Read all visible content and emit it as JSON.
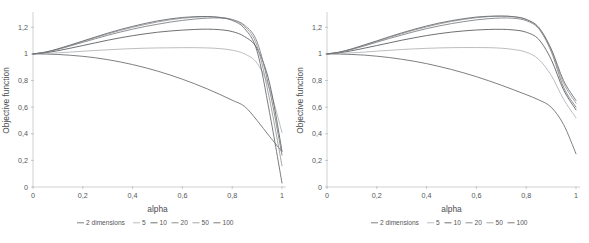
{
  "figure": {
    "panel_count": 2,
    "background_color": "#ffffff"
  },
  "panels": [
    {
      "name": "left-panel",
      "xlabel": "alpha",
      "ylabel": "Objective function",
      "x_ticks": [
        "0",
        "0,2",
        "0,4",
        "0,6",
        "0,8",
        "1"
      ],
      "y_ticks": [
        "0",
        "0,2",
        "0,4",
        "0,6",
        "0,8",
        "1",
        "1,2"
      ],
      "legend_prefix": "2 dimensions",
      "legend_items": [
        "5",
        "10",
        "20",
        "50",
        "100"
      ]
    },
    {
      "name": "right-panel",
      "xlabel": "alpha",
      "ylabel": "Objective function",
      "x_ticks": [
        "0",
        "0,2",
        "0,4",
        "0,6",
        "0,8",
        "1"
      ],
      "y_ticks": [
        "0",
        "0,2",
        "0,4",
        "0,6",
        "0,8",
        "1",
        "1,2"
      ],
      "legend_prefix": "2 dimensions",
      "legend_items": [
        "5",
        "10",
        "20",
        "50",
        "100"
      ]
    }
  ],
  "chart_data": [
    {
      "type": "line",
      "title": "",
      "panel": "left",
      "xlabel": "alpha",
      "ylabel": "Objective function",
      "xlim": [
        0,
        1
      ],
      "ylim": [
        0,
        1.3
      ],
      "x_ticks": [
        0,
        0.2,
        0.4,
        0.6,
        0.8,
        1
      ],
      "y_ticks": [
        0,
        0.2,
        0.4,
        0.6,
        0.8,
        1,
        1.2
      ],
      "grid": false,
      "legend_position": "below-axis",
      "legend_title": "2 dimensions",
      "x": [
        0,
        0.05,
        0.1,
        0.15,
        0.2,
        0.25,
        0.3,
        0.35,
        0.4,
        0.45,
        0.5,
        0.55,
        0.6,
        0.65,
        0.7,
        0.75,
        0.8,
        0.85,
        0.9,
        0.95,
        1
      ],
      "series": [
        {
          "name": "2",
          "color": "#6e7073",
          "values": [
            1.0,
            0.999,
            0.996,
            0.99,
            0.982,
            0.971,
            0.957,
            0.94,
            0.92,
            0.897,
            0.871,
            0.842,
            0.81,
            0.775,
            0.737,
            0.696,
            0.652,
            0.605,
            0.5,
            0.38,
            0.265
          ]
        },
        {
          "name": "5",
          "color": "#b4b6b8",
          "values": [
            1.0,
            1.003,
            1.008,
            1.014,
            1.02,
            1.026,
            1.031,
            1.036,
            1.04,
            1.043,
            1.045,
            1.046,
            1.047,
            1.047,
            1.045,
            1.04,
            1.028,
            1.0,
            0.93,
            0.74,
            0.41
          ]
        },
        {
          "name": "10",
          "color": "#5d6063",
          "values": [
            1.0,
            1.009,
            1.024,
            1.043,
            1.063,
            1.083,
            1.103,
            1.121,
            1.137,
            1.151,
            1.163,
            1.172,
            1.179,
            1.184,
            1.186,
            1.182,
            1.168,
            1.13,
            1.04,
            0.78,
            0.27
          ]
        },
        {
          "name": "20",
          "color": "#808285",
          "values": [
            1.0,
            1.012,
            1.034,
            1.06,
            1.087,
            1.114,
            1.14,
            1.164,
            1.186,
            1.206,
            1.223,
            1.239,
            1.252,
            1.262,
            1.269,
            1.27,
            1.258,
            1.215,
            1.09,
            0.73,
            0.24
          ]
        },
        {
          "name": "50",
          "color": "#9a9c9f",
          "values": [
            1.0,
            1.013,
            1.036,
            1.064,
            1.093,
            1.122,
            1.15,
            1.176,
            1.2,
            1.221,
            1.24,
            1.256,
            1.268,
            1.276,
            1.279,
            1.275,
            1.258,
            1.205,
            1.06,
            0.66,
            0.16
          ]
        },
        {
          "name": "100",
          "color": "#6b6d70",
          "values": [
            1.0,
            1.014,
            1.038,
            1.067,
            1.097,
            1.127,
            1.156,
            1.183,
            1.207,
            1.229,
            1.248,
            1.263,
            1.274,
            1.28,
            1.281,
            1.274,
            1.252,
            1.19,
            1.02,
            0.56,
            0.03
          ]
        }
      ]
    },
    {
      "type": "line",
      "title": "",
      "panel": "right",
      "xlabel": "alpha",
      "ylabel": "Objective function",
      "xlim": [
        0,
        1
      ],
      "ylim": [
        0,
        1.3
      ],
      "x_ticks": [
        0,
        0.2,
        0.4,
        0.6,
        0.8,
        1
      ],
      "y_ticks": [
        0,
        0.2,
        0.4,
        0.6,
        0.8,
        1,
        1.2
      ],
      "grid": false,
      "legend_position": "below-axis",
      "legend_title": "2 dimensions",
      "x": [
        0,
        0.05,
        0.1,
        0.15,
        0.2,
        0.25,
        0.3,
        0.35,
        0.4,
        0.45,
        0.5,
        0.55,
        0.6,
        0.65,
        0.7,
        0.75,
        0.8,
        0.85,
        0.9,
        0.95,
        1
      ],
      "series": [
        {
          "name": "2",
          "color": "#6e7073",
          "values": [
            1.0,
            0.999,
            0.996,
            0.991,
            0.983,
            0.973,
            0.96,
            0.945,
            0.927,
            0.906,
            0.883,
            0.857,
            0.829,
            0.798,
            0.765,
            0.73,
            0.694,
            0.655,
            0.6,
            0.47,
            0.25
          ]
        },
        {
          "name": "5",
          "color": "#b4b6b8",
          "values": [
            1.0,
            1.003,
            1.008,
            1.014,
            1.021,
            1.027,
            1.033,
            1.038,
            1.042,
            1.045,
            1.047,
            1.048,
            1.048,
            1.047,
            1.043,
            1.033,
            1.013,
            0.96,
            0.84,
            0.66,
            0.52
          ]
        },
        {
          "name": "10",
          "color": "#5d6063",
          "values": [
            1.0,
            1.009,
            1.024,
            1.043,
            1.063,
            1.083,
            1.103,
            1.121,
            1.138,
            1.152,
            1.164,
            1.173,
            1.18,
            1.184,
            1.185,
            1.18,
            1.163,
            1.11,
            0.96,
            0.73,
            0.58
          ]
        },
        {
          "name": "20",
          "color": "#808285",
          "values": [
            1.0,
            1.012,
            1.034,
            1.06,
            1.088,
            1.116,
            1.142,
            1.167,
            1.19,
            1.21,
            1.228,
            1.243,
            1.256,
            1.265,
            1.27,
            1.268,
            1.25,
            1.19,
            1.02,
            0.75,
            0.6
          ]
        },
        {
          "name": "50",
          "color": "#9a9c9f",
          "values": [
            1.0,
            1.013,
            1.037,
            1.065,
            1.094,
            1.124,
            1.152,
            1.179,
            1.203,
            1.225,
            1.244,
            1.26,
            1.272,
            1.28,
            1.283,
            1.279,
            1.258,
            1.195,
            1.03,
            0.78,
            0.63
          ]
        },
        {
          "name": "100",
          "color": "#6b6d70",
          "values": [
            1.0,
            1.014,
            1.038,
            1.068,
            1.098,
            1.129,
            1.158,
            1.185,
            1.21,
            1.232,
            1.25,
            1.265,
            1.277,
            1.283,
            1.285,
            1.28,
            1.26,
            1.2,
            1.04,
            0.8,
            0.65
          ]
        }
      ]
    }
  ]
}
